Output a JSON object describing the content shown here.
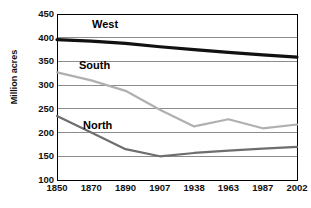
{
  "chart_data": {
    "type": "line",
    "title": "",
    "subtitle": "",
    "xlabel": "",
    "ylabel": "Million acres",
    "categories": [
      "1850",
      "1870",
      "1890",
      "1907",
      "1938",
      "1963",
      "1987",
      "2002"
    ],
    "ylim": [
      100,
      450
    ],
    "yticks": [
      100,
      150,
      200,
      250,
      300,
      350,
      400,
      450
    ],
    "grid": "horizontal",
    "legend": "inline-labels",
    "series": [
      {
        "name": "West",
        "color": "#111111",
        "width": 3.2,
        "values": [
          396,
          393,
          388,
          381,
          375,
          369,
          364,
          359
        ]
      },
      {
        "name": "South",
        "color": "#b0b0b0",
        "width": 2.2,
        "values": [
          327,
          310,
          288,
          248,
          213,
          228,
          209,
          217
        ]
      },
      {
        "name": "North",
        "color": "#6e6e6e",
        "width": 2.2,
        "values": [
          235,
          200,
          165,
          150,
          157,
          162,
          166,
          170
        ]
      }
    ],
    "annotations": [
      {
        "label": "West",
        "series": "West"
      },
      {
        "label": "South",
        "series": "South"
      },
      {
        "label": "North",
        "series": "North"
      }
    ]
  },
  "axes": {
    "y_title": "Million acres",
    "y_tick_labels": [
      "450",
      "400",
      "350",
      "300",
      "250",
      "200",
      "150",
      "100"
    ],
    "x_tick_labels": [
      "1850",
      "1870",
      "1890",
      "1907",
      "1938",
      "1963",
      "1987",
      "2002"
    ]
  },
  "labels": {
    "west": "West",
    "south": "South",
    "north": "North"
  },
  "colors": {
    "west_line": "#111111",
    "south_line": "#b0b0b0",
    "north_line": "#6e6e6e",
    "gridline": "#8c8c8c",
    "axis": "#000000",
    "background": "#ffffff",
    "text": "#111111"
  },
  "geometry": {
    "plot_left": 57,
    "plot_right": 297,
    "plot_top": 14,
    "plot_bottom": 180
  }
}
